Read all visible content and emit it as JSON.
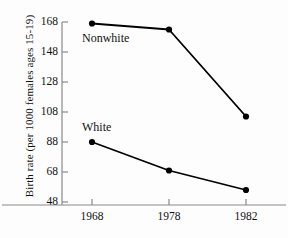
{
  "chart_data": {
    "type": "line",
    "title": "",
    "xlabel": "",
    "ylabel": "Birth rate (per 1000 females ages 15-19)",
    "categories": [
      "1968",
      "1978",
      "1982"
    ],
    "x": [
      1968,
      1978,
      1982
    ],
    "xlim": [
      1964,
      1986
    ],
    "ylim": [
      48,
      168
    ],
    "yticks": [
      48,
      68,
      88,
      108,
      128,
      148,
      168
    ],
    "ytick_labels": [
      "48",
      "68",
      "88",
      "108",
      "128",
      "148",
      "168"
    ],
    "xticks": [
      1968,
      1978,
      1982
    ],
    "xtick_labels": [
      "1968",
      "1978",
      "1982"
    ],
    "grid": false,
    "legend_position": "inline-annotation",
    "series": [
      {
        "name": "Nonwhite",
        "values": [
          167,
          163,
          105
        ],
        "color": "#000000",
        "marker": "circle"
      },
      {
        "name": "White",
        "values": [
          88,
          69,
          56
        ],
        "color": "#000000",
        "marker": "circle"
      }
    ],
    "annotations": [
      {
        "text": "Nonwhite",
        "series": "Nonwhite"
      },
      {
        "text": "White",
        "series": "White"
      }
    ]
  },
  "axis": {
    "line_color": "#8a8a8a",
    "tick_color": "#8a8a8a"
  },
  "ytick_text": {
    "t168": "168",
    "t148": "148",
    "t128": "128",
    "t108": "108",
    "t88": "88",
    "t68": "68",
    "t48": "48"
  },
  "xtick_text": {
    "t1968": "1968",
    "t1978": "1978",
    "t1982": "1982"
  },
  "labels": {
    "ylabel": "Birth rate (per 1000 females ages 15-19)",
    "nonwhite": "Nonwhite",
    "white": "White"
  }
}
